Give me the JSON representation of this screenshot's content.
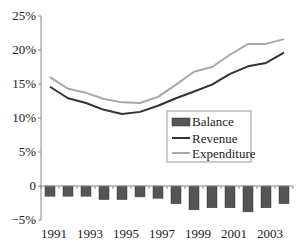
{
  "chart_data": {
    "type": "bar+line",
    "title": "",
    "xlabel": "",
    "ylabel": "",
    "ylim": [
      -5,
      25
    ],
    "y_ticks": [
      "25%",
      "20%",
      "15%",
      "10%",
      "5%",
      "0",
      "−5%"
    ],
    "y_tick_values": [
      25,
      20,
      15,
      10,
      5,
      0,
      -5
    ],
    "x_tick_labels": [
      "1991",
      "1993",
      "1995",
      "1997",
      "1999",
      "2001",
      "2003"
    ],
    "categories": [
      "1991",
      "1992",
      "1993",
      "1994",
      "1995",
      "1996",
      "1997",
      "1998",
      "1999",
      "2000",
      "2001",
      "2002",
      "2003",
      "2004"
    ],
    "series": [
      {
        "name": "Balance",
        "type": "bar",
        "color": "#555555",
        "values": [
          -1.5,
          -1.5,
          -1.5,
          -2.0,
          -2.0,
          -1.6,
          -1.8,
          -2.6,
          -3.5,
          -3.2,
          -3.2,
          -3.8,
          -3.2,
          -2.6
        ]
      },
      {
        "name": "Revenue",
        "type": "line",
        "color": "#333333",
        "values": [
          14.6,
          12.9,
          12.2,
          11.2,
          10.6,
          10.9,
          11.8,
          12.9,
          13.9,
          14.9,
          16.5,
          17.6,
          18.1,
          19.6
        ]
      },
      {
        "name": "Expenditure",
        "type": "line",
        "color": "#a8a8a8",
        "values": [
          16.0,
          14.3,
          13.7,
          12.8,
          12.3,
          12.2,
          13.1,
          14.9,
          16.8,
          17.5,
          19.3,
          20.9,
          20.9,
          21.6
        ]
      }
    ],
    "legend": {
      "position": "center-right",
      "entries": [
        "Balance",
        "Revenue",
        "Expenditure"
      ]
    },
    "grid": false
  }
}
